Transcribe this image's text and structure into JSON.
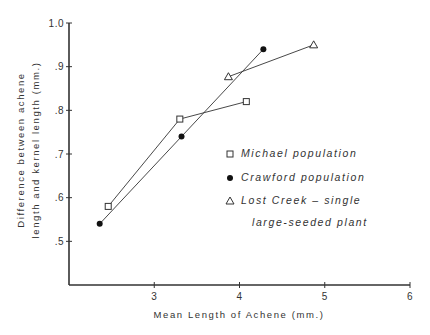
{
  "chart_data": {
    "type": "line",
    "title": "",
    "xlabel": "Mean Length of Achene (mm.)",
    "ylabel": [
      "Difference between achene",
      "length and kernel length (mm.)"
    ],
    "xlim": [
      2.0,
      6.0
    ],
    "ylim": [
      0.4,
      1.0
    ],
    "xticks": [
      3,
      4,
      5,
      6
    ],
    "xtick_labels": [
      "3",
      "4",
      "5",
      "6"
    ],
    "yticks": [
      0.5,
      0.6,
      0.7,
      0.8,
      0.9,
      1.0
    ],
    "ytick_labels": [
      ".5",
      ".6",
      ".7",
      ".8",
      ".9",
      "1.0"
    ],
    "grid": false,
    "legend_position": "right-middle",
    "series": [
      {
        "name": "Michael population",
        "marker": "open-square",
        "x": [
          2.46,
          3.3,
          4.08
        ],
        "y": [
          0.58,
          0.78,
          0.82
        ]
      },
      {
        "name": "Crawford population",
        "marker": "filled-circle",
        "x": [
          2.36,
          3.32,
          4.28
        ],
        "y": [
          0.54,
          0.74,
          0.94
        ]
      },
      {
        "name": "Lost Creek - single large-seeded plant",
        "legend_lines": [
          "Lost Creek – single",
          "large-seeded plant"
        ],
        "marker": "open-triangle",
        "x": [
          3.87,
          4.87
        ],
        "y": [
          0.877,
          0.95
        ]
      }
    ]
  },
  "colors": {
    "ink": "#333333",
    "background": "#ffffff"
  }
}
